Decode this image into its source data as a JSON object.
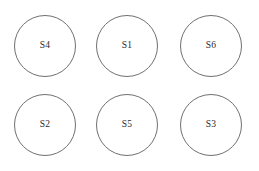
{
  "figure": {
    "background_color": "#ffffff",
    "stroke_color": "#707070",
    "label_color": "#2b2b2b",
    "width": 259,
    "height": 171
  },
  "diagram": {
    "type": "node-grid",
    "rows": 2,
    "columns": 3,
    "node_shape": "circle",
    "node_diameter": 62,
    "nodes": [
      {
        "label": "S4",
        "row": 0,
        "column": 0,
        "cx": 45,
        "cy": 46
      },
      {
        "label": "S1",
        "row": 0,
        "column": 1,
        "cx": 127,
        "cy": 46
      },
      {
        "label": "S6",
        "row": 0,
        "column": 2,
        "cx": 211,
        "cy": 46
      },
      {
        "label": "S2",
        "row": 1,
        "column": 0,
        "cx": 45,
        "cy": 125
      },
      {
        "label": "S5",
        "row": 1,
        "column": 1,
        "cx": 127,
        "cy": 125
      },
      {
        "label": "S3",
        "row": 1,
        "column": 2,
        "cx": 211,
        "cy": 125
      }
    ]
  }
}
